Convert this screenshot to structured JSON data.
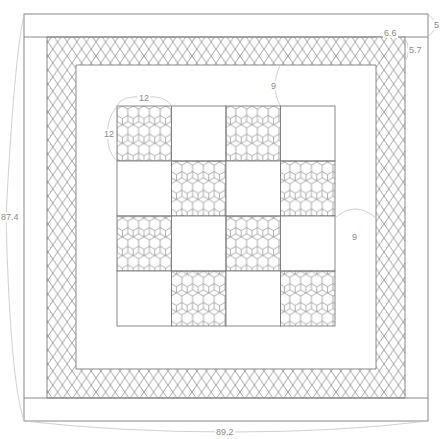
{
  "diagram": {
    "type": "quilt-layout-schematic",
    "colors": {
      "line": "#7a7a7a",
      "pattern": "#8c8c8c",
      "dimension": "#c4c4c4",
      "label": "#8a8a8a",
      "background": "#ffffff"
    },
    "dimensions": {
      "overall_width": "89.2",
      "overall_height": "87.4",
      "outer_border_width": "5",
      "lattice_border_width": "6.6",
      "lattice_border_height": "5.7",
      "inner_border_top": "9",
      "inner_border_right": "9",
      "block_width": "12",
      "block_height": "12"
    },
    "checkerboard": {
      "rows": 4,
      "cols": 4,
      "hex_cells": [
        [
          0,
          0
        ],
        [
          0,
          2
        ],
        [
          1,
          1
        ],
        [
          1,
          3
        ],
        [
          2,
          0
        ],
        [
          2,
          2
        ],
        [
          3,
          1
        ],
        [
          3,
          3
        ]
      ]
    },
    "patterns": {
      "lattice_border": "diamond-crosshatch",
      "blocks": "hexagon-honeycomb"
    }
  }
}
